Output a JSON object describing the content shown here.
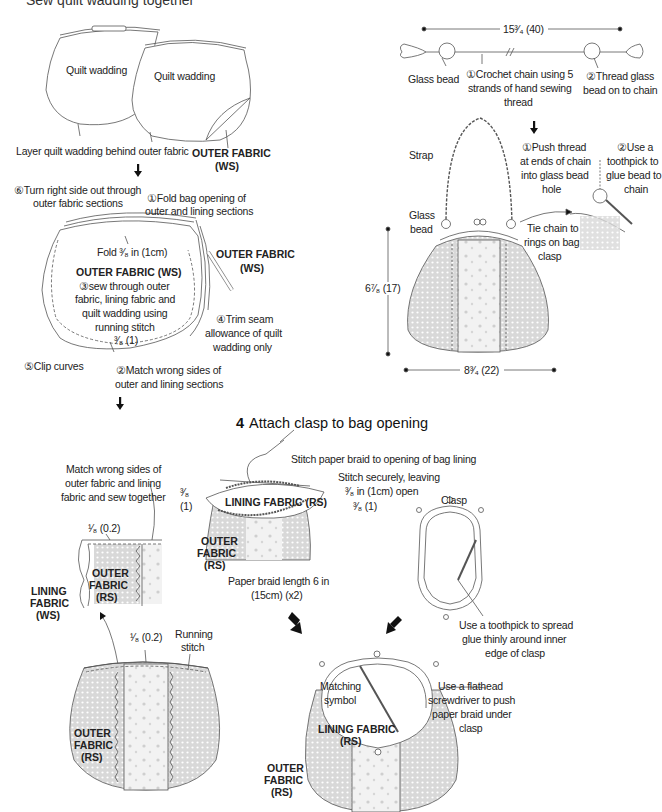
{
  "page": {
    "cut_header": "Sew quilt wadding together",
    "section4_number": "4",
    "section4_title": "Attach clasp to bag opening"
  },
  "step3_wadding": {
    "wadding_label_1": "Quilt wadding",
    "wadding_label_2": "Quilt wadding",
    "layer_caption": "Layer quilt wadding behind outer fabric",
    "outer_fabric_ws_1": "OUTER FABRIC",
    "outer_fabric_ws_2": "(WS)"
  },
  "step3_sew": {
    "turn_right_side_1": "⑥Turn right side out through",
    "turn_right_side_2": "outer fabric sections",
    "fold_opening_1": "①Fold bag opening of",
    "fold_opening_2": "outer and lining sections",
    "fold_measure": "Fold ³⁄₈ in (1cm)",
    "outer_fabric_ws_title": "OUTER FABRIC (WS)",
    "sew_through_1": "③sew through outer",
    "sew_through_2": "fabric, lining fabric and",
    "sew_through_3": "quilt wadding using",
    "sew_through_4": "running stitch",
    "seam_measure": "³⁄₈ (1)",
    "outer_fabric_right_1": "OUTER FABRIC",
    "outer_fabric_right_2": "(WS)",
    "trim_seam_1": "④Trim seam",
    "trim_seam_2": "allowance of quilt",
    "trim_seam_3": "wadding only",
    "clip_curves": "⑤Clip curves",
    "match_wrong_1": "②Match wrong sides of",
    "match_wrong_2": "outer and lining sections"
  },
  "strap": {
    "length_measure": "15³⁄₄ (40)",
    "glass_bead": "Glass bead",
    "crochet_1": "①Crochet chain using 5",
    "crochet_2": "strands of hand sewing",
    "crochet_3": "thread",
    "thread_bead_1": "②Thread glass",
    "thread_bead_2": "bead on to chain",
    "strap_label": "Strap",
    "push_thread_1": "①Push thread",
    "push_thread_2": "at ends of chain",
    "push_thread_3": "into glass bead",
    "push_thread_4": "hole",
    "use_toothpick_1": "②Use a",
    "use_toothpick_2": "toothpick to",
    "use_toothpick_3": "glue bead to",
    "use_toothpick_4": "chain",
    "glass_bead_2_1": "Glass",
    "glass_bead_2_2": "bead",
    "tie_chain_1": "Tie chain to",
    "tie_chain_2": "rings on bag",
    "tie_chain_3": "clasp",
    "height_measure": "6⁷⁄₈ (17)",
    "width_measure": "8³⁄₄ (22)"
  },
  "step4": {
    "match_sew_1": "Match wrong sides of",
    "match_sew_2": "outer fabric and lining",
    "match_sew_3": "fabric and sew together",
    "eighth_measure_1": "¹⁄₈ (0.2)",
    "outer_rs_1a": "OUTER",
    "outer_rs_1b": "FABRIC",
    "outer_rs_1c": "(RS)",
    "lining_ws_a": "LINING",
    "lining_ws_b": "FABRIC",
    "lining_ws_c": "(WS)",
    "eighth_measure_2": "¹⁄₈ (0.2)",
    "running_stitch_1": "Running",
    "running_stitch_2": "stitch",
    "outer_rs_2a": "OUTER",
    "outer_rs_2b": "FABRIC",
    "outer_rs_2c": "(RS)",
    "stitch_braid": "Stitch paper braid to opening of bag lining",
    "stitch_secure_1": "Stitch securely, leaving",
    "stitch_secure_2": "³⁄₈ in (1cm) open",
    "three_eighths_left_1": "³⁄₈",
    "three_eighths_left_2": "(1)",
    "three_eighths_right": "³⁄₈ (1)",
    "lining_rs_title": "LINING FABRIC (RS)",
    "outer_rs_3a": "OUTER",
    "outer_rs_3b": "FABRIC",
    "outer_rs_3c": "(RS)",
    "braid_length_1": "Paper braid length 6 in",
    "braid_length_2": "(15cm) (x2)",
    "clasp_label": "Clasp",
    "spread_glue_1": "Use a toothpick to spread",
    "spread_glue_2": "glue thinly around inner",
    "spread_glue_3": "edge of clasp",
    "matching_symbol_1": "Matching",
    "matching_symbol_2": "symbol",
    "lining_rs_2a": "LINING FABRIC",
    "lining_rs_2b": "(RS)",
    "flathead_1": "Use a flathead",
    "flathead_2": "screwdriver to push",
    "flathead_3": "paper braid under",
    "flathead_4": "clasp",
    "outer_rs_4a": "OUTER",
    "outer_rs_4b": "FABRIC",
    "outer_rs_4c": "(RS)"
  }
}
